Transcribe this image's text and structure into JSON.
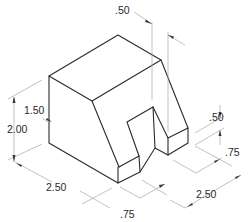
{
  "diagram": {
    "type": "isometric technical drawing",
    "colors": {
      "object_lines": "#2a2a2a",
      "dimension_lines": "#a8a8a8",
      "background": "#ffffff"
    },
    "dimensions": [
      {
        "id": "top_slot_width",
        "label": ".50"
      },
      {
        "id": "left_height_upper",
        "label": "1.50"
      },
      {
        "id": "left_total_height",
        "label": "2.00"
      },
      {
        "id": "right_block_height",
        "label": ".50"
      },
      {
        "id": "right_block_depth",
        "label": ".75"
      },
      {
        "id": "bottom_left_length",
        "label": "2.50"
      },
      {
        "id": "bottom_slot_offset",
        "label": ".75"
      },
      {
        "id": "bottom_right_length",
        "label": "2.50"
      }
    ]
  }
}
